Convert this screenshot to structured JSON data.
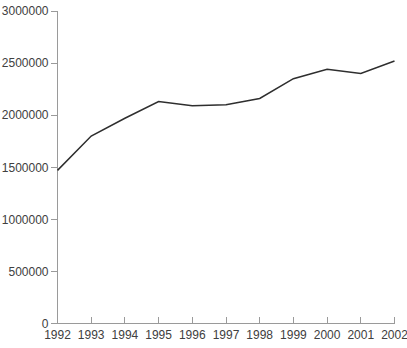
{
  "chart_data": {
    "type": "line",
    "title": "",
    "xlabel": "",
    "ylabel": "",
    "categories": [
      "1992",
      "1993",
      "1994",
      "1995",
      "1996",
      "1997",
      "1998",
      "1999",
      "2000",
      "2001",
      "2002"
    ],
    "values": [
      1470000,
      1800000,
      1970000,
      2130000,
      2090000,
      2100000,
      2160000,
      2350000,
      2440000,
      2400000,
      2520000
    ],
    "ylim": [
      0,
      3000000
    ],
    "ytick_interval": 500000,
    "ytick_labels": [
      "0",
      "500000",
      "1000000",
      "1500000",
      "2000000",
      "2500000",
      "3000000"
    ],
    "xtick_labels": [
      "1992",
      "1993",
      "1994",
      "1995",
      "1996",
      "1997",
      "1998",
      "1999",
      "2000",
      "2001",
      "2002"
    ],
    "grid": false,
    "legend": false,
    "colors": {
      "line": "#2e2e2e",
      "axis": "#9a9a9a",
      "tick_text": "#404040",
      "background": "#ffffff"
    }
  }
}
